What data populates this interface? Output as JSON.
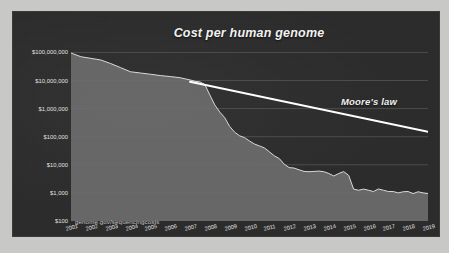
{
  "figure": {
    "panel_bg": "#2b2b2b",
    "page_bg": "#c8c8c6",
    "area_fill": "#6d6d6d",
    "area_line": "#d8d8d8",
    "moores_line_color": "#ffffff",
    "grid_color": "#5a5a5a",
    "text_color": "#e6e6e6"
  },
  "annotations": {
    "moores_law_label": "Moore's law",
    "source_note": "genome.gov/sequencingcosts"
  },
  "chart_data": {
    "type": "area",
    "title": "Cost per human genome",
    "xlabel": "",
    "ylabel": "",
    "yscale": "log",
    "ylim": [
      100,
      300000000
    ],
    "grid": true,
    "legend": "none",
    "ytick_labels": [
      "$100,000,000",
      "$10,000,000",
      "$1,000,000",
      "$100,000",
      "$10,000",
      "$1,000",
      "$100"
    ],
    "ytick_values": [
      100000000,
      10000000,
      1000000,
      100000,
      10000,
      1000,
      100
    ],
    "xtick_labels": [
      "2001",
      "2002",
      "2003",
      "2004",
      "2005",
      "2006",
      "2007",
      "2008",
      "2009",
      "2010",
      "2011",
      "2012",
      "2013",
      "2014",
      "2015",
      "2016",
      "2017",
      "2018",
      "2019"
    ],
    "categories": [
      "2001",
      "2002",
      "2003",
      "2004",
      "2005",
      "2006",
      "2007",
      "2008",
      "2009",
      "2010",
      "2011",
      "2012",
      "2013",
      "2014",
      "2015",
      "2016",
      "2017",
      "2018",
      "2019"
    ],
    "series": [
      {
        "name": "Cost per human genome",
        "x": [
          2001.0,
          2001.5,
          2002.0,
          2002.5,
          2003.0,
          2003.5,
          2004.0,
          2004.5,
          2005.0,
          2005.5,
          2006.0,
          2006.5,
          2007.0,
          2007.25,
          2007.5,
          2007.75,
          2008.0,
          2008.25,
          2008.5,
          2008.75,
          2009.0,
          2009.25,
          2009.5,
          2009.75,
          2010.0,
          2010.25,
          2010.5,
          2010.75,
          2011.0,
          2011.25,
          2011.5,
          2011.75,
          2012.0,
          2012.25,
          2012.5,
          2012.75,
          2013.0,
          2013.25,
          2013.5,
          2013.75,
          2014.0,
          2014.25,
          2014.5,
          2014.75,
          2015.0,
          2015.25,
          2015.5,
          2015.75,
          2016.0,
          2016.25,
          2016.5,
          2016.75,
          2017.0,
          2017.25,
          2017.5,
          2017.75,
          2018.0,
          2018.25,
          2018.5,
          2018.75,
          2019.0
        ],
        "values": [
          95263072,
          70175437,
          61448422,
          53751684,
          40157554,
          28780376,
          20442576,
          18519312,
          16712371,
          15010941,
          13801124,
          12585521,
          10474556,
          9408739,
          8927342,
          7147571,
          3063820,
          1352982,
          752080,
          478066,
          232735,
          144932,
          108065,
          92532,
          70333,
          54932,
          47050,
          40000,
          29092,
          20963,
          16712,
          10497,
          7950,
          7666,
          6618,
          5826,
          5671,
          5826,
          5985,
          5671,
          4920,
          4008,
          4905,
          5731,
          4211,
          1363,
          1245,
          1363,
          1245,
          1121,
          1380,
          1245,
          1121,
          1120,
          1000,
          1100,
          1121,
          942,
          1100,
          1000,
          942
        ]
      },
      {
        "name": "Moore's law",
        "x": [
          2007.0,
          2019.0
        ],
        "values": [
          9000000,
          150000
        ]
      }
    ]
  }
}
